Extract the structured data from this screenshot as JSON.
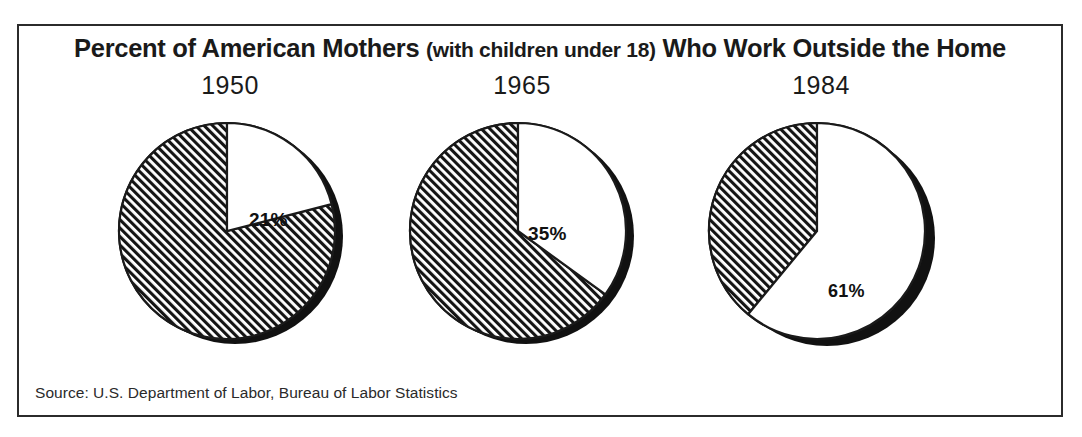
{
  "chart_data": {
    "type": "pie",
    "title": "Percent of American Mothers (with children under 18)  Who Work Outside the Home",
    "title_main_before": "Percent of American Mothers ",
    "title_paren": "(with children under 18)",
    "title_main_after": "  Who Work Outside the Home",
    "subtitle": "",
    "xlabel": "",
    "ylabel": "",
    "source": "Source: U.S. Department of Labor, Bureau of Labor Statistics",
    "legend_position": "none",
    "grid": false,
    "series_labels": [
      "Work outside the home",
      "Do not work outside the home"
    ],
    "panels": [
      {
        "year": "1950",
        "value_label": "21%",
        "value": 21,
        "remainder": 79,
        "slices": [
          {
            "name": "work-outside-home",
            "percent": 21,
            "fill": "white"
          },
          {
            "name": "not-working-outside-home",
            "percent": 79,
            "fill": "hatched"
          }
        ]
      },
      {
        "year": "1965",
        "value_label": "35%",
        "value": 35,
        "remainder": 65,
        "slices": [
          {
            "name": "work-outside-home",
            "percent": 35,
            "fill": "white"
          },
          {
            "name": "not-working-outside-home",
            "percent": 65,
            "fill": "hatched"
          }
        ]
      },
      {
        "year": "1984",
        "value_label": "61%",
        "value": 61,
        "remainder": 39,
        "slices": [
          {
            "name": "work-outside-home",
            "percent": 61,
            "fill": "white"
          },
          {
            "name": "not-working-outside-home",
            "percent": 39,
            "fill": "hatched"
          }
        ]
      }
    ],
    "categories": [
      "1950",
      "1965",
      "1984"
    ],
    "values": [
      21,
      35,
      61
    ],
    "colors": {
      "ink": "#1a1a1a",
      "shadow": "#111111",
      "face": "#ffffff",
      "hatch": "#141414",
      "frame": "#2b2b2b"
    }
  }
}
